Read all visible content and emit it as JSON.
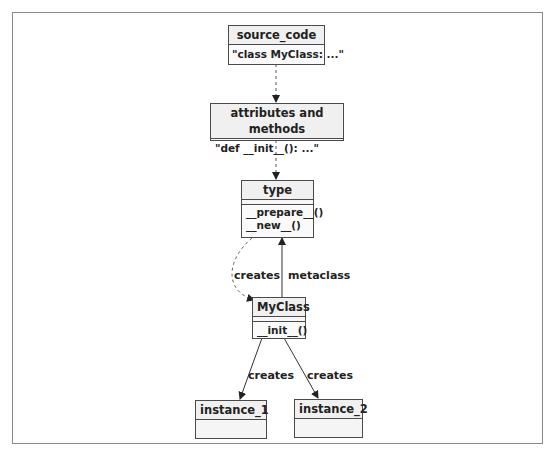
{
  "diagram": {
    "nodes": {
      "source_code": {
        "title": "source_code",
        "body": "\"class MyClass: ...\""
      },
      "attributes": {
        "title": "attributes and methods",
        "body": "\"def __init__(): ...\""
      },
      "type": {
        "title": "type",
        "methods": [
          "__prepare__()",
          "__new__()"
        ]
      },
      "myclass": {
        "title": "MyClass",
        "methods": [
          "__init__()"
        ]
      },
      "instance_1": {
        "title": "instance_1"
      },
      "instance_2": {
        "title": "instance_2"
      }
    },
    "edges": {
      "type_creates_myclass": {
        "label": "creates",
        "style": "dashed"
      },
      "myclass_metaclass_type": {
        "label": "metaclass",
        "style": "solid"
      },
      "myclass_creates_instance_1": {
        "label": "creates",
        "style": "solid"
      },
      "myclass_creates_instance_2": {
        "label": "creates",
        "style": "solid"
      }
    }
  },
  "colors": {
    "border": "#4a4a4a",
    "header_fill": "#f0f0f0",
    "frame": "#8a8a8a",
    "edge_solid": "#333333",
    "edge_dashed": "#666666"
  }
}
